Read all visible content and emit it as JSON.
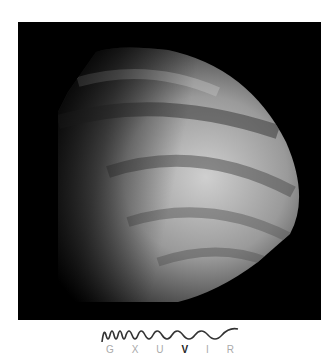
{
  "image": {
    "subject": "planet-venus-cloud-bands",
    "background": "#000000"
  },
  "spectrum": {
    "labels": [
      "G",
      "X",
      "U",
      "V",
      "I",
      "R"
    ],
    "active_index": 3,
    "active_label": "V",
    "wave_color": "#333333"
  }
}
